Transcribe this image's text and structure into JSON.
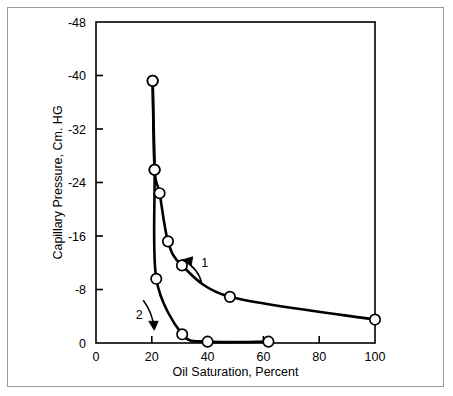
{
  "figure": {
    "border_color": "#9a9a9a",
    "background": "#ffffff"
  },
  "chart_data": {
    "type": "line",
    "title": "",
    "xlabel": "Oil Saturation, Percent",
    "ylabel": "Capillary Pressure, Cm. HG",
    "xlim": [
      0,
      100
    ],
    "ylim": [
      0,
      -48
    ],
    "xticks": [
      0,
      20,
      40,
      60,
      80,
      100
    ],
    "yticks": [
      0,
      -8,
      -16,
      -24,
      -32,
      -40,
      -48
    ],
    "xtick_labels": [
      "0",
      "20",
      "40",
      "60",
      "80",
      "100"
    ],
    "ytick_labels": [
      "0",
      "-8",
      "-16",
      "-24",
      "-32",
      "-40",
      "-48"
    ],
    "grid": false,
    "legend": "none",
    "line_color": "#000000",
    "marker": "open-circle",
    "marker_face": "#ffffff",
    "series": [
      {
        "name": "1",
        "label": "1",
        "points": [
          {
            "x": 20.3,
            "y": -39.2
          },
          {
            "x": 21.0,
            "y": -25.9
          },
          {
            "x": 22.8,
            "y": -22.4
          },
          {
            "x": 25.8,
            "y": -15.2
          },
          {
            "x": 30.8,
            "y": -11.6
          },
          {
            "x": 48.0,
            "y": -6.9
          },
          {
            "x": 100.0,
            "y": -3.5
          }
        ]
      },
      {
        "name": "2",
        "label": "2",
        "points": [
          {
            "x": 20.3,
            "y": -39.2
          },
          {
            "x": 21.0,
            "y": -25.9
          },
          {
            "x": 21.6,
            "y": -9.6
          },
          {
            "x": 30.9,
            "y": -1.3
          },
          {
            "x": 40.0,
            "y": -0.2
          },
          {
            "x": 61.8,
            "y": -0.2
          }
        ]
      }
    ],
    "annotations": [
      {
        "text": "1",
        "x": 39.0,
        "y": -12.0,
        "arrow": "up-left"
      },
      {
        "text": "2",
        "x": 15.5,
        "y": -4.3,
        "arrow": "down-right"
      }
    ]
  }
}
